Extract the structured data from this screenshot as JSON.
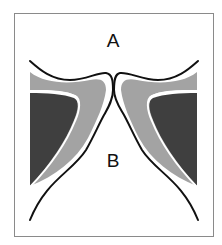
{
  "diagram": {
    "labels": {
      "upper_region": "A",
      "lower_region": "B"
    },
    "colors": {
      "background": "#ffffff",
      "frame": "#8a8a8a",
      "outline": "#111111",
      "light_fill": "#a3a3a3",
      "dark_fill": "#3f3f3f"
    }
  }
}
